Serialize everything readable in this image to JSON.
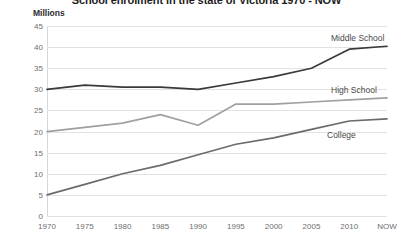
{
  "chart_data": {
    "type": "line",
    "title": "School enrolment in the state of Victoria 1970 - NOW",
    "xlabel": "",
    "ylabel": "Millions",
    "ylim": [
      0,
      45
    ],
    "yticks": [
      0,
      5,
      10,
      15,
      20,
      25,
      30,
      35,
      40,
      45
    ],
    "grid": true,
    "legend_position": "inline-right",
    "categories": [
      "1970",
      "1975",
      "1980",
      "1985",
      "1990",
      "1995",
      "2000",
      "2005",
      "2010",
      "NOW"
    ],
    "series": [
      {
        "name": "Middle School",
        "color": "#3a3a3a",
        "values": [
          30,
          31,
          30.5,
          30.5,
          30,
          31.5,
          33,
          35,
          39.5,
          40.2
        ]
      },
      {
        "name": "High School",
        "color": "#a0a0a0",
        "values": [
          20,
          21,
          22,
          24,
          21.5,
          26.5,
          26.5,
          27,
          27.5,
          28
        ]
      },
      {
        "name": "College",
        "color": "#6b6b6b",
        "values": [
          5,
          7.5,
          10,
          12,
          14.5,
          17,
          18.5,
          20.5,
          22.5,
          23
        ]
      }
    ]
  },
  "axis": {
    "unit_label": "Millions"
  }
}
